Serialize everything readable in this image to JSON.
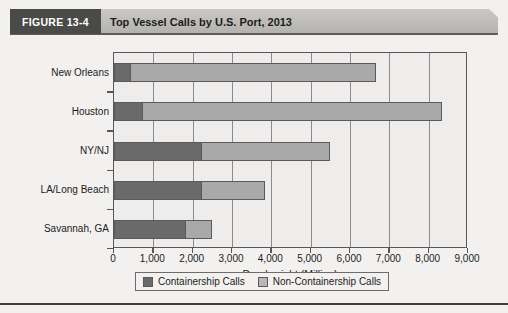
{
  "figure": {
    "number_label": "FIGURE 13-4",
    "title": "Top Vessel Calls by U.S. Port, 2013"
  },
  "colors": {
    "containership": "#6a6a6a",
    "non_containership": "#a9a9a9",
    "header_band": "#bdbcb9",
    "figure_number_box": "#4a4a48",
    "plot_background": "#eeedeb",
    "axis": "#57575a"
  },
  "chart_data": {
    "type": "bar",
    "orientation": "horizontal",
    "stacked": true,
    "title": "Top Vessel Calls by U.S. Port, 2013",
    "xlabel": "Deadweight (Million)",
    "ylabel": "",
    "categories": [
      "New Orleans",
      "Houston",
      "NY/NJ",
      "LA/Long Beach",
      "Savannah, GA"
    ],
    "series": [
      {
        "name": "Containership Calls",
        "values": [
          400,
          700,
          2200,
          2200,
          1800
        ]
      },
      {
        "name": "Non-Containership Calls",
        "values": [
          6250,
          7630,
          3300,
          1650,
          700
        ]
      }
    ],
    "totals": [
      6650,
      8330,
      5500,
      3850,
      2500
    ],
    "xlim": [
      0,
      9000
    ],
    "xticks": [
      0,
      1000,
      2000,
      3000,
      4000,
      5000,
      6000,
      7000,
      8000,
      9000
    ],
    "xtick_labels": [
      "0",
      "1,000",
      "2,000",
      "3,000",
      "4,000",
      "5,000",
      "6,000",
      "7,000",
      "8,000",
      "9,000"
    ],
    "grid": true,
    "legend_position": "bottom"
  },
  "legend": {
    "items": [
      {
        "label": "Containership Calls",
        "swatch": "dark"
      },
      {
        "label": "Non-Containership Calls",
        "swatch": "light"
      }
    ]
  }
}
